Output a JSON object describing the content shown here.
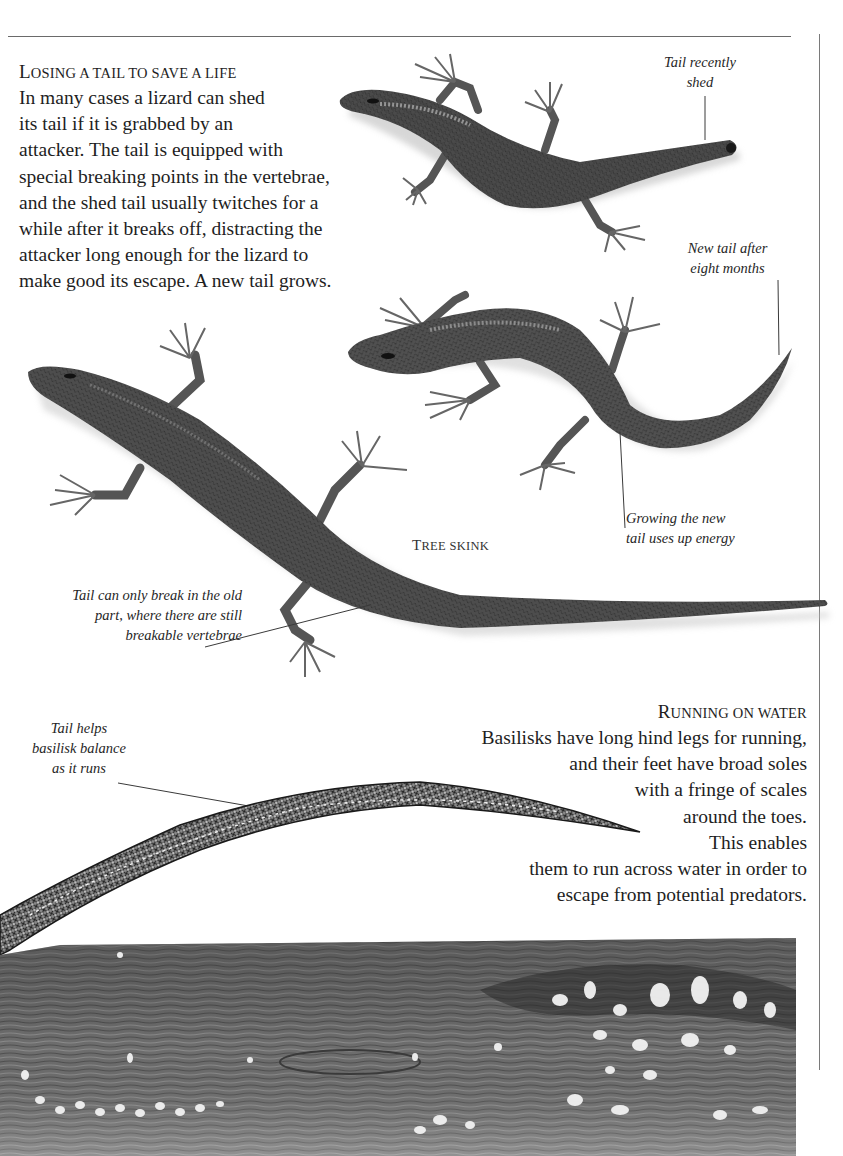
{
  "page": {
    "background": "#ffffff",
    "ink_color": "#1e1e1e"
  },
  "losing_tail": {
    "heading_first": "L",
    "heading_rest": "OSING A TAIL TO SAVE A LIFE",
    "heading": "Losing a tail to save a life",
    "lines": [
      "In many cases a lizard can shed",
      "its tail if it is grabbed by an",
      "attacker. The tail is equipped with",
      "special breaking points in the vertebrae,",
      "and the shed tail usually twitches for a",
      "while after it breaks off, distracting the",
      "attacker long enough for the lizard to",
      "make good its escape. A new tail grows."
    ]
  },
  "captions": {
    "tail_shed": [
      "Tail recently",
      "shed"
    ],
    "new_tail": [
      "New tail after",
      "eight months"
    ],
    "growing": [
      "Growing the new",
      "tail uses up energy"
    ],
    "break_old": [
      "Tail can only break in the old",
      "part, where there are still",
      "breakable vertebrae"
    ],
    "basilisk_tail": [
      "Tail helps",
      "basilisk balance",
      "as it runs"
    ]
  },
  "species_label": {
    "first": "T",
    "rest": "REE SKINK",
    "full": "Tree skink"
  },
  "running_on_water": {
    "heading_first": "R",
    "heading_rest": "UNNING ON WATER",
    "heading": "Running on water",
    "lines": [
      "Basilisks have long hind legs for running,",
      "and their feet have broad soles",
      "with a fringe of scales",
      "around the toes.",
      "This enables",
      "them to run across water in order to",
      "escape from potential predators."
    ]
  },
  "illustrations": {
    "lizard_top": "tree-skink-tail-recently-shed",
    "lizard_middle": "tree-skink-new-tail-eight-months",
    "lizard_large": "tree-skink-full-tail",
    "basilisk_tail": "basilisk-tail-drawing",
    "water": "water-surface-with-splashes"
  }
}
